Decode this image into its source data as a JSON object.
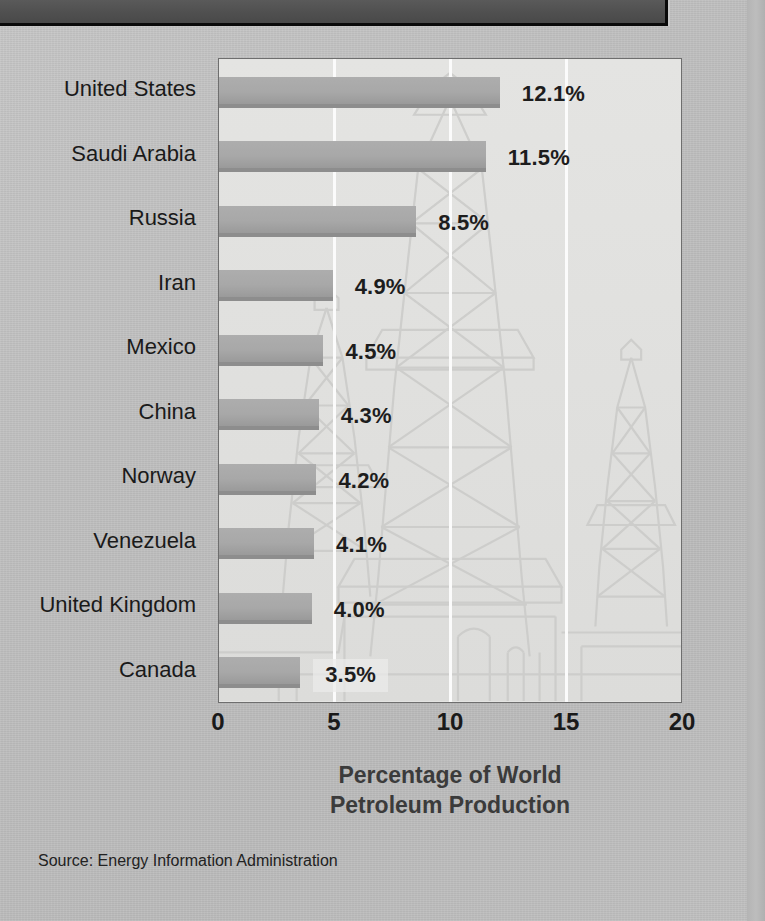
{
  "banner": {
    "label": ""
  },
  "chart_data": {
    "type": "bar",
    "orientation": "horizontal",
    "title": "",
    "xlabel": "Percentage of World Petroleum Production",
    "ylabel": "",
    "xlim": [
      0,
      20
    ],
    "xticks": [
      "0",
      "5",
      "10",
      "15",
      "20"
    ],
    "xtick_values": [
      0,
      5,
      10,
      15,
      20
    ],
    "grid": "vertical gridlines at 5, 10, 15",
    "legend": "none",
    "categories": [
      "United States",
      "Saudi Arabia",
      "Russia",
      "Iran",
      "Mexico",
      "China",
      "Norway",
      "Venezuela",
      "United Kingdom",
      "Canada"
    ],
    "values": [
      12.1,
      11.5,
      8.5,
      4.9,
      4.5,
      4.3,
      4.2,
      4.1,
      4.0,
      3.5
    ],
    "value_labels": [
      "12.1%",
      "11.5%",
      "8.5%",
      "4.9%",
      "4.5%",
      "4.3%",
      "4.2%",
      "4.1%",
      "4.0%",
      "3.5%"
    ],
    "annotations": [
      "Source: Energy Information Administration"
    ],
    "background_illustration": "oil-derrick-watermark"
  },
  "axis_title": {
    "line1": "Percentage of World",
    "line2": "Petroleum Production"
  },
  "source": {
    "label": "Source:",
    "text": "Energy Information Administration",
    "full": "Source:  Energy Information Administration"
  },
  "colors": {
    "page_background": "#bcbcbc",
    "banner": "#505050",
    "plot_background": "#e4e4e2",
    "bar_fill": "#a8a8a8",
    "bar_shadow": "#8d8d8d",
    "gridline": "#fbfbfb",
    "text": "#1a1a1a",
    "axis_title_text": "#3b3b3b"
  }
}
